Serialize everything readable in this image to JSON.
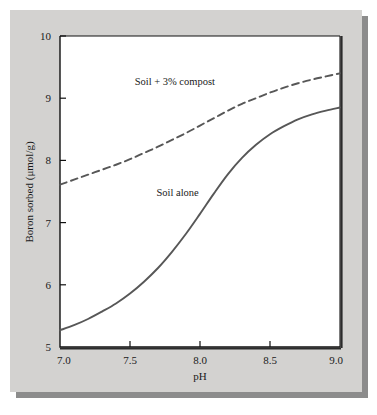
{
  "chart_data": {
    "type": "line",
    "title": "",
    "xlabel": "pH",
    "ylabel": "Boron sorbed (μmol/g)",
    "xlim": [
      7.0,
      9.0
    ],
    "ylim": [
      5,
      10
    ],
    "grid": false,
    "legend_position": "inline-annotations",
    "xticks": [
      "7.0",
      "7.5",
      "8.0",
      "8.5",
      "9.0"
    ],
    "xtick_values": [
      7.0,
      7.5,
      8.0,
      8.5,
      9.0
    ],
    "yticks": [
      "5",
      "6",
      "7",
      "8",
      "9",
      "10"
    ],
    "ytick_values": [
      5,
      6,
      7,
      8,
      9,
      10
    ],
    "series": [
      {
        "name": "Soil + 3% compost",
        "style": "dashed",
        "color": "#575757",
        "label_x": 7.82,
        "label_y": 9.28,
        "x": [
          7.0,
          7.1,
          7.2,
          7.3,
          7.4,
          7.5,
          7.6,
          7.7,
          7.8,
          7.9,
          8.0,
          8.1,
          8.2,
          8.3,
          8.4,
          8.5,
          8.6,
          8.7,
          8.8,
          8.9,
          9.0
        ],
        "values": [
          7.61,
          7.69,
          7.77,
          7.85,
          7.93,
          8.02,
          8.12,
          8.22,
          8.33,
          8.44,
          8.56,
          8.68,
          8.8,
          8.91,
          9.0,
          9.09,
          9.17,
          9.24,
          9.3,
          9.35,
          9.4
        ]
      },
      {
        "name": "Soil alone",
        "style": "solid",
        "color": "#575757",
        "label_x": 7.84,
        "label_y": 7.49,
        "x": [
          7.0,
          7.1,
          7.2,
          7.3,
          7.4,
          7.5,
          7.6,
          7.7,
          7.8,
          7.9,
          8.0,
          8.1,
          8.2,
          8.3,
          8.4,
          8.5,
          8.6,
          8.7,
          8.8,
          8.9,
          9.0
        ],
        "values": [
          5.27,
          5.35,
          5.45,
          5.57,
          5.7,
          5.86,
          6.05,
          6.27,
          6.53,
          6.82,
          7.14,
          7.47,
          7.78,
          8.04,
          8.25,
          8.42,
          8.55,
          8.66,
          8.74,
          8.8,
          8.85
        ]
      }
    ]
  }
}
